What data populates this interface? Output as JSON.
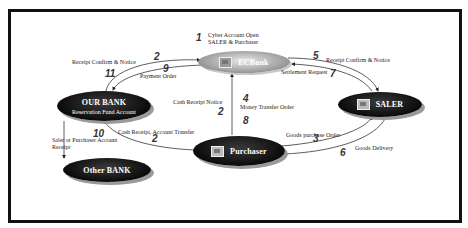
{
  "nodes": {
    "ecbank": {
      "label": "ECBank"
    },
    "our_bank": {
      "label": "OUR BANK",
      "sublabel": "Reservation Fund Account"
    },
    "saler": {
      "label": "SALER"
    },
    "purchaser": {
      "label": "Purchaser"
    },
    "other_bank": {
      "label": "Other BANK"
    }
  },
  "edges": [
    {
      "step": "1",
      "label": "Cyber Account Open SALER & Purchaser",
      "label_line1": "Cyber Account Open",
      "label_line2": "SALER & Purchaser"
    },
    {
      "step": "2",
      "label": "Receipt Confirm & Notice",
      "from": "ECBank",
      "to": "OUR BANK"
    },
    {
      "step": "9",
      "label": "Payment Order",
      "from": "OUR BANK",
      "to": "ECBank"
    },
    {
      "step": "11",
      "label": ""
    },
    {
      "step": "5",
      "label": "Receipt Confirm & Notice",
      "from": "ECBank",
      "to": "SALER"
    },
    {
      "step": "7",
      "label": "Settlement Request",
      "from": "SALER",
      "to": "ECBank"
    },
    {
      "step": "2",
      "label": "Cash Receipt Notice"
    },
    {
      "step": "4",
      "label": "Money Transfer Order"
    },
    {
      "step": "8",
      "label": ""
    },
    {
      "step": "2",
      "label": "Cash Receipt, Account Transfer"
    },
    {
      "step": "10",
      "label": "Saler or Purchaser Account Receipt",
      "label_line1": "Saler or Purchaser Account",
      "label_line2": "Receipt"
    },
    {
      "step": "3",
      "label": "Goods purchase Order"
    },
    {
      "step": "6",
      "label": "Goods Delivery"
    }
  ],
  "labels": {
    "cyber_l1": "Cyber Account Open",
    "cyber_l2": "SALER & Purchaser",
    "receipt_left": "Receipt Confirm & Notice",
    "payment_order": "Payment Order",
    "receipt_right": "Receipt Confirm & Notice",
    "settlement": "Settlement Request",
    "cash_notice": "Cash Receipt Notice",
    "money_transfer": "Money Transfer Order",
    "cash_transfer": "Cash Receipt, Account Transfer",
    "saler_purchaser_l1": "Saler or Purchaser Account",
    "saler_purchaser_l2": "Receipt",
    "goods_order": "Goods purchase Order",
    "goods_delivery": "Goods Delivery"
  },
  "numbers": {
    "n1": "1",
    "n2a": "2",
    "n9": "9",
    "n11": "11",
    "n5": "5",
    "n7": "7",
    "n2b": "2",
    "n4": "4",
    "n8": "8",
    "n2c": "2",
    "n10": "10",
    "n3": "3",
    "n6": "6"
  }
}
